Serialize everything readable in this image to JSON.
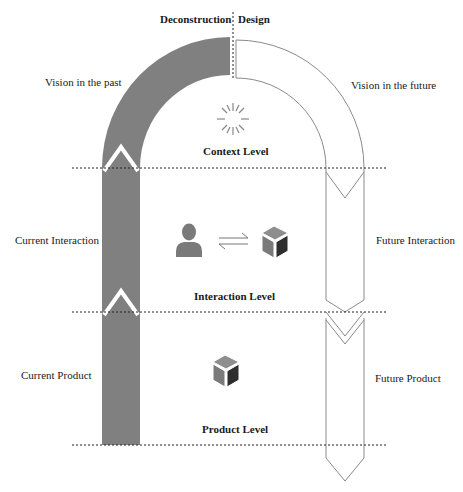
{
  "header": {
    "left_label": "Deconstruction",
    "right_label": "Design"
  },
  "left_side": {
    "vision": "Vision in the past",
    "interaction": "Current Interaction",
    "product": "Current Product"
  },
  "right_side": {
    "vision": "Vision in the future",
    "interaction": "Future Interaction",
    "product": "Future Product"
  },
  "levels": {
    "context": "Context Level",
    "interaction": "Interaction Level",
    "product": "Product Level"
  },
  "icons": {
    "context": "sunburst-icon",
    "user": "user-icon",
    "exchange": "exchange-arrows-icon",
    "product": "cube-icon"
  },
  "colors": {
    "past_fill": "#808080",
    "future_stroke": "#8a8a8a",
    "divider": "#222222",
    "cube_light": "#8e8e8e",
    "cube_mid": "#7a7a7a",
    "cube_dark": "#2e2e2e"
  }
}
